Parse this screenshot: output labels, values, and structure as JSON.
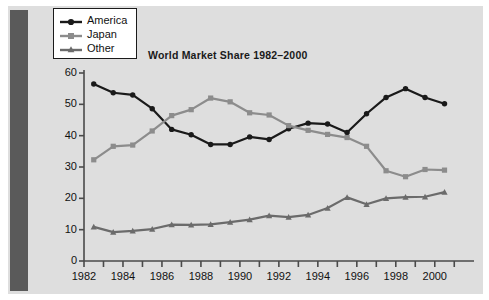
{
  "figure": {
    "title": "World Market Share 1982–2000",
    "background_color": "#dedede",
    "page_color": "#ffffff",
    "gutter_color": "#5a5a5a"
  },
  "legend": {
    "position": "top-left",
    "border_color": "#1a1a1a",
    "background_color": "#ffffff",
    "entries": [
      {
        "label": "America",
        "color": "#1a1a1a",
        "marker": "circle"
      },
      {
        "label": "Japan",
        "color": "#8c8c8c",
        "marker": "square"
      },
      {
        "label": "Other",
        "color": "#6b6b6b",
        "marker": "triangle"
      }
    ]
  },
  "axes": {
    "y_ticks": [
      "60",
      "50",
      "40",
      "30",
      "20",
      "10",
      "0"
    ],
    "x_ticks": [
      "1982",
      "1984",
      "1986",
      "1988",
      "1990",
      "1992",
      "1994",
      "1996",
      "1998",
      "2000"
    ],
    "axis_color": "#4a4a4a"
  },
  "chart_data": {
    "type": "line",
    "title": "World Market Share 1982–2000",
    "xlabel": "",
    "ylabel": "",
    "xlim": [
      1982,
      2001.5
    ],
    "ylim": [
      0,
      60
    ],
    "grid": false,
    "legend_position": "top-left",
    "x": [
      1982.5,
      1983.5,
      1984.5,
      1985.5,
      1986.5,
      1987.5,
      1988.5,
      1989.5,
      1990.5,
      1991.5,
      1992.5,
      1993.5,
      1994.5,
      1995.5,
      1996.5,
      1997.5,
      1998.5,
      1999.5,
      2000.5
    ],
    "x_tick_values": [
      1982,
      1983,
      1984,
      1985,
      1986,
      1987,
      1988,
      1989,
      1990,
      1991,
      1992,
      1993,
      1994,
      1995,
      1996,
      1997,
      1998,
      1999,
      2000,
      2001
    ],
    "x_tick_labels": [
      "1982",
      "",
      "1984",
      "",
      "1986",
      "",
      "1988",
      "",
      "1990",
      "",
      "1992",
      "",
      "1994",
      "",
      "1996",
      "",
      "1998",
      "",
      "2000",
      ""
    ],
    "y_tick_values": [
      0,
      10,
      20,
      30,
      40,
      50,
      60
    ],
    "series": [
      {
        "name": "America",
        "color": "#1a1a1a",
        "marker": "circle",
        "values": [
          56.5,
          53.7,
          53.0,
          48.6,
          42.0,
          40.3,
          37.2,
          37.2,
          39.6,
          38.8,
          42.2,
          44.0,
          43.7,
          41.0,
          47.0,
          52.2,
          55.0,
          52.2,
          50.2
        ]
      },
      {
        "name": "Japan",
        "color": "#8c8c8c",
        "marker": "square",
        "values": [
          32.3,
          36.6,
          37.0,
          41.5,
          46.4,
          48.3,
          52.0,
          50.8,
          47.3,
          46.6,
          43.2,
          41.7,
          40.4,
          39.4,
          36.6,
          28.8,
          26.9,
          29.2,
          29.0
        ]
      },
      {
        "name": "Other",
        "color": "#6b6b6b",
        "marker": "triangle",
        "values": [
          10.9,
          9.2,
          9.6,
          10.2,
          11.6,
          11.5,
          11.7,
          12.4,
          13.2,
          14.5,
          14.0,
          14.7,
          16.9,
          20.3,
          18.1,
          20.0,
          20.4,
          20.5,
          22.0
        ]
      }
    ]
  }
}
